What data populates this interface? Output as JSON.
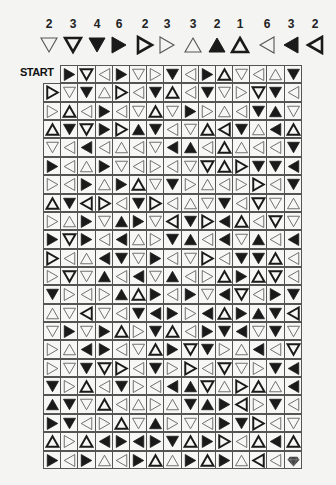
{
  "legend": [
    {
      "count": "2",
      "symbol": "Dt"
    },
    {
      "count": "3",
      "symbol": "Db"
    },
    {
      "count": "4",
      "symbol": "Df"
    },
    {
      "count": "6",
      "symbol": "Rf"
    },
    {
      "count": "2",
      "symbol": "Rb"
    },
    {
      "count": "3",
      "symbol": "Rt"
    },
    {
      "count": "3",
      "symbol": "Ut"
    },
    {
      "count": "2",
      "symbol": "Uf"
    },
    {
      "count": "1",
      "symbol": "Ub"
    },
    {
      "count": "6",
      "symbol": "Lt"
    },
    {
      "count": "3",
      "symbol": "Lf"
    },
    {
      "count": "2",
      "symbol": "Lb"
    }
  ],
  "symbol_key": {
    "direction": {
      "D": "down",
      "U": "up",
      "L": "left",
      "R": "right"
    },
    "style": {
      "t": "thin-outline",
      "b": "bold-outline",
      "f": "filled"
    },
    "GEM": "goal-gem"
  },
  "start_label": "START",
  "grid": [
    [
      "START",
      "Rf",
      "Db",
      "Lt",
      "Rf",
      "Dt",
      "Rt",
      "Df",
      "Lt",
      "Rf",
      "Ub",
      "Dt",
      "Lt",
      "Ut",
      "Df"
    ],
    [
      "Rb",
      "Dt",
      "Df",
      "Ut",
      "Rb",
      "Lt",
      "Df",
      "Ub",
      "Lt",
      "Df",
      "Dt",
      "Rt",
      "Db",
      "Df",
      "Lt"
    ],
    [
      "Rt",
      "Ub",
      "Lt",
      "Rf",
      "Lt",
      "Dt",
      "Ub",
      "Dt",
      "Rf",
      "Rt",
      "Ut",
      "Lt",
      "Df",
      "Uf",
      "Dt"
    ],
    [
      "Ub",
      "Df",
      "Db",
      "Rf",
      "Rb",
      "Uf",
      "Df",
      "Lt",
      "Dt",
      "Ub",
      "Lb",
      "Df",
      "Ut",
      "Lf",
      "Ub"
    ],
    [
      "Dt",
      "Lt",
      "Lf",
      "Lt",
      "Ut",
      "Lt",
      "Dt",
      "Lf",
      "Uf",
      "Lt",
      "Ub",
      "Ut",
      "Lt",
      "Lt",
      "Df"
    ],
    [
      "Rf",
      "Lt",
      "Ut",
      "Rf",
      "Dt",
      "Lt",
      "Rt",
      "Lt",
      "Dt",
      "Db",
      "Ub",
      "Rb",
      "Df",
      "Df",
      "Lf"
    ],
    [
      "Rt",
      "Lt",
      "Rf",
      "Ut",
      "Rf",
      "Ub",
      "Dt",
      "Df",
      "Rt",
      "Ut",
      "Lt",
      "Rt",
      "Rb",
      "Lt",
      "Df"
    ],
    [
      "Ub",
      "Df",
      "Lb",
      "Rb",
      "Lt",
      "Df",
      "Rb",
      "Lt",
      "Ut",
      "Dt",
      "Df",
      "Lt",
      "Db",
      "Dt",
      "Ut"
    ],
    [
      "Rt",
      "Ut",
      "Rf",
      "Dt",
      "Uf",
      "Rf",
      "Dt",
      "Lb",
      "Df",
      "Rb",
      "Lf",
      "Ub",
      "Lt",
      "Db",
      "Dt"
    ],
    [
      "Rf",
      "Db",
      "Rf",
      "Lt",
      "Lf",
      "Ut",
      "Rt",
      "Df",
      "Uf",
      "Lt",
      "Lf",
      "Dt",
      "Uf",
      "Lt",
      "Lf"
    ],
    [
      "Rb",
      "Lt",
      "Ut",
      "Lf",
      "Df",
      "Dt",
      "Rf",
      "Lt",
      "Dt",
      "Rb",
      "Lt",
      "Df",
      "Df",
      "Ub",
      "Lt"
    ],
    [
      "Rt",
      "Db",
      "Dt",
      "Uf",
      "Lt",
      "Lf",
      "Dt",
      "Uf",
      "Lt",
      "Rt",
      "Ub",
      "Rf",
      "Ub",
      "Db",
      "Lt"
    ],
    [
      "Df",
      "Rt",
      "Lt",
      "Rt",
      "Uf",
      "Ub",
      "Rf",
      "Lt",
      "Rf",
      "Dt",
      "Lf",
      "Db",
      "Lt",
      "Rf",
      "Df"
    ],
    [
      "Ut",
      "Dt",
      "Lb",
      "Dt",
      "Lt",
      "Df",
      "Lf",
      "Rf",
      "Rt",
      "Lf",
      "Ub",
      "Rf",
      "Uf",
      "Df",
      "Lb"
    ],
    [
      "Dt",
      "Rf",
      "Dt",
      "Rf",
      "Ub",
      "Rt",
      "Df",
      "Ub",
      "Lt",
      "Rf",
      "Df",
      "Lf",
      "Dt",
      "Df",
      "Dt"
    ],
    [
      "Rt",
      "Ut",
      "Lf",
      "Rf",
      "Lt",
      "Dt",
      "Ub",
      "Rf",
      "Db",
      "Df",
      "Rt",
      "Ut",
      "Lf",
      "Lt",
      "Db"
    ],
    [
      "Rt",
      "Dt",
      "Df",
      "Db",
      "Rb",
      "Lt",
      "Df",
      "Rt",
      "Rb",
      "Lt",
      "Db",
      "Dt",
      "Rt",
      "Df",
      "Lf"
    ],
    [
      "Df",
      "Rt",
      "Ub",
      "Lt",
      "Df",
      "Rt",
      "Lt",
      "Lf",
      "Uf",
      "Db",
      "Ut",
      "Rb",
      "Ub",
      "Ut",
      "Lf"
    ],
    [
      "Uf",
      "Df",
      "Dt",
      "Ub",
      "Lt",
      "Ut",
      "Rt",
      "Ut",
      "Df",
      "Uf",
      "Rf",
      "Lb",
      "Rt",
      "Df",
      "Lt"
    ],
    [
      "Rf",
      "Df",
      "Lt",
      "Rt",
      "Ub",
      "Dt",
      "Uf",
      "Rt",
      "Dt",
      "Lt",
      "Rf",
      "Df",
      "Rb",
      "Lt",
      "Dt"
    ],
    [
      "Ub",
      "Rt",
      "Ub",
      "Lf",
      "Rf",
      "Lf",
      "Rf",
      "Df",
      "Ub",
      "Rf",
      "Rb",
      "Lt",
      "Ub",
      "Lf",
      "Ub"
    ],
    [
      "Rf",
      "Lt",
      "Rf",
      "Ut",
      "Lt",
      "Rf",
      "Ub",
      "Ut",
      "Rf",
      "Ub",
      "Rf",
      "Ut",
      "Lb",
      "Lt",
      "GEM"
    ]
  ],
  "colors": {
    "ink": "#1a1a1a",
    "thin": "#555555",
    "gem": "#444444",
    "grid_line": "#555555"
  }
}
